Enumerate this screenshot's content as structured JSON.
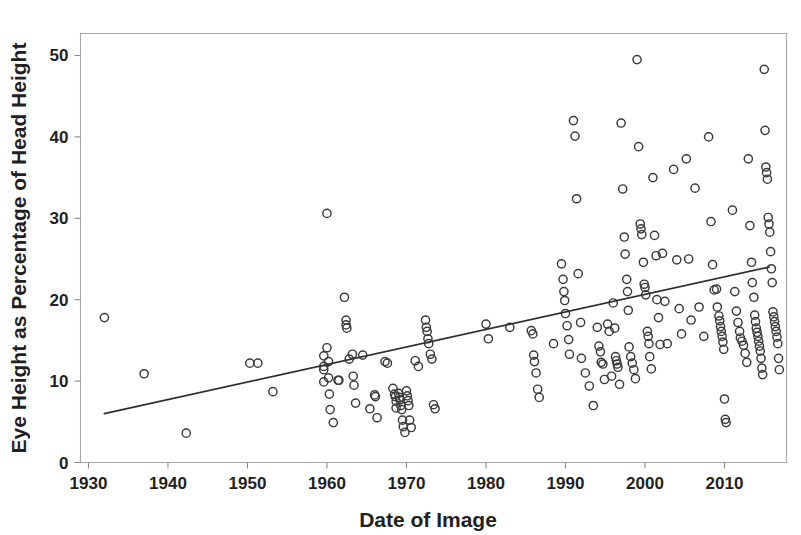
{
  "chart_data": {
    "type": "scatter",
    "title": "",
    "subtitle": "",
    "xlabel": "Date of Image",
    "ylabel": "Eye Height as Percentage of Head Height",
    "xlim": [
      1929.0,
      2017.8
    ],
    "ylim": [
      0,
      52.7
    ],
    "xticks": [
      1930,
      1940,
      1950,
      1960,
      1970,
      1980,
      1990,
      2000,
      2010
    ],
    "yticks": [
      0,
      10,
      20,
      30,
      40,
      50
    ],
    "xtick_labels": [
      "1930",
      "1940",
      "1950",
      "1960",
      "1970",
      "1980",
      "1990",
      "2000",
      "2010"
    ],
    "ytick_labels": [
      "0",
      "10",
      "20",
      "30",
      "40",
      "50"
    ],
    "grid": false,
    "legend": null,
    "legend_position": "none",
    "marker_style": "open-circle",
    "marker_color": "#3a3a3a",
    "frame_color": "#a8a8a8",
    "text_color": "#231f20",
    "background_color": "#ffffff",
    "annotations": [],
    "series": [
      {
        "name": "Eye height vs date",
        "marker": "open-circle",
        "points": [
          [
            1932.0,
            17.8
          ],
          [
            1937.0,
            10.9
          ],
          [
            1942.3,
            3.6
          ],
          [
            1950.3,
            12.2
          ],
          [
            1951.3,
            12.2
          ],
          [
            1953.2,
            8.7
          ],
          [
            1959.6,
            13.1
          ],
          [
            1959.6,
            11.8
          ],
          [
            1959.6,
            11.4
          ],
          [
            1959.6,
            9.9
          ],
          [
            1960.0,
            30.6
          ],
          [
            1960.0,
            14.1
          ],
          [
            1960.2,
            12.4
          ],
          [
            1960.2,
            10.4
          ],
          [
            1960.3,
            8.4
          ],
          [
            1960.4,
            6.5
          ],
          [
            1960.8,
            4.9
          ],
          [
            1961.4,
            10.1
          ],
          [
            1961.5,
            10.1
          ],
          [
            1962.2,
            20.3
          ],
          [
            1962.4,
            17.5
          ],
          [
            1962.4,
            16.9
          ],
          [
            1962.5,
            16.5
          ],
          [
            1962.8,
            12.7
          ],
          [
            1963.2,
            13.3
          ],
          [
            1963.3,
            10.6
          ],
          [
            1963.4,
            9.5
          ],
          [
            1963.6,
            7.3
          ],
          [
            1964.5,
            13.2
          ],
          [
            1965.4,
            6.6
          ],
          [
            1966.0,
            8.3
          ],
          [
            1966.1,
            8.1
          ],
          [
            1966.3,
            5.5
          ],
          [
            1967.3,
            12.4
          ],
          [
            1967.6,
            12.2
          ],
          [
            1968.3,
            9.1
          ],
          [
            1968.5,
            8.4
          ],
          [
            1968.6,
            8.1
          ],
          [
            1968.7,
            7.5
          ],
          [
            1968.7,
            6.7
          ],
          [
            1969.0,
            8.5
          ],
          [
            1969.1,
            8.0
          ],
          [
            1969.2,
            7.7
          ],
          [
            1969.3,
            7.0
          ],
          [
            1969.4,
            6.5
          ],
          [
            1969.5,
            5.2
          ],
          [
            1969.6,
            4.4
          ],
          [
            1969.8,
            3.7
          ],
          [
            1970.0,
            8.8
          ],
          [
            1970.1,
            8.2
          ],
          [
            1970.2,
            7.6
          ],
          [
            1970.3,
            7.0
          ],
          [
            1970.4,
            5.2
          ],
          [
            1970.6,
            4.3
          ],
          [
            1971.1,
            12.5
          ],
          [
            1971.5,
            11.8
          ],
          [
            1972.4,
            17.5
          ],
          [
            1972.5,
            16.6
          ],
          [
            1972.6,
            16.1
          ],
          [
            1972.7,
            15.2
          ],
          [
            1972.8,
            14.6
          ],
          [
            1973.0,
            13.3
          ],
          [
            1973.2,
            12.7
          ],
          [
            1973.4,
            7.1
          ],
          [
            1973.6,
            6.6
          ],
          [
            1980.0,
            17.0
          ],
          [
            1980.3,
            15.2
          ],
          [
            1983.0,
            16.6
          ],
          [
            1985.7,
            16.2
          ],
          [
            1985.9,
            15.8
          ],
          [
            1986.0,
            13.2
          ],
          [
            1986.1,
            12.4
          ],
          [
            1986.3,
            11.0
          ],
          [
            1986.5,
            9.0
          ],
          [
            1986.7,
            8.0
          ],
          [
            1988.5,
            14.6
          ],
          [
            1989.5,
            24.4
          ],
          [
            1989.7,
            22.5
          ],
          [
            1989.8,
            21.0
          ],
          [
            1989.9,
            19.9
          ],
          [
            1990.0,
            18.3
          ],
          [
            1990.2,
            16.8
          ],
          [
            1990.4,
            15.1
          ],
          [
            1990.5,
            13.3
          ],
          [
            1991.0,
            42.0
          ],
          [
            1991.2,
            40.1
          ],
          [
            1991.4,
            32.4
          ],
          [
            1991.6,
            23.2
          ],
          [
            1991.9,
            17.2
          ],
          [
            1992.0,
            12.8
          ],
          [
            1992.5,
            11.0
          ],
          [
            1993.0,
            9.4
          ],
          [
            1993.5,
            7.0
          ],
          [
            1994.0,
            16.6
          ],
          [
            1994.2,
            14.3
          ],
          [
            1994.4,
            13.6
          ],
          [
            1994.5,
            12.3
          ],
          [
            1994.7,
            12.1
          ],
          [
            1994.9,
            10.2
          ],
          [
            1995.3,
            17.0
          ],
          [
            1995.5,
            16.1
          ],
          [
            1995.8,
            10.6
          ],
          [
            1996.0,
            19.6
          ],
          [
            1996.2,
            16.5
          ],
          [
            1996.3,
            13.0
          ],
          [
            1996.4,
            12.5
          ],
          [
            1996.5,
            12.1
          ],
          [
            1996.6,
            11.7
          ],
          [
            1996.8,
            9.6
          ],
          [
            1997.0,
            41.7
          ],
          [
            1997.2,
            33.6
          ],
          [
            1997.4,
            27.7
          ],
          [
            1997.5,
            25.6
          ],
          [
            1997.7,
            22.5
          ],
          [
            1997.8,
            21.0
          ],
          [
            1997.9,
            18.7
          ],
          [
            1998.0,
            14.2
          ],
          [
            1998.2,
            13.0
          ],
          [
            1998.4,
            12.2
          ],
          [
            1998.6,
            11.4
          ],
          [
            1998.8,
            10.3
          ],
          [
            1999.0,
            49.5
          ],
          [
            1999.2,
            38.8
          ],
          [
            1999.4,
            29.3
          ],
          [
            1999.5,
            28.7
          ],
          [
            1999.6,
            28.0
          ],
          [
            1999.8,
            24.6
          ],
          [
            1999.9,
            21.9
          ],
          [
            2000.0,
            21.5
          ],
          [
            2000.1,
            20.6
          ],
          [
            2000.3,
            16.1
          ],
          [
            2000.4,
            15.5
          ],
          [
            2000.5,
            14.6
          ],
          [
            2000.6,
            13.0
          ],
          [
            2000.8,
            11.5
          ],
          [
            2001.0,
            35.0
          ],
          [
            2001.2,
            27.9
          ],
          [
            2001.4,
            25.4
          ],
          [
            2001.5,
            20.0
          ],
          [
            2001.7,
            17.8
          ],
          [
            2001.9,
            14.5
          ],
          [
            2002.2,
            25.7
          ],
          [
            2002.5,
            19.8
          ],
          [
            2002.8,
            14.6
          ],
          [
            2003.6,
            36.0
          ],
          [
            2004.0,
            24.9
          ],
          [
            2004.3,
            18.9
          ],
          [
            2004.6,
            15.8
          ],
          [
            2005.2,
            37.3
          ],
          [
            2005.5,
            25.0
          ],
          [
            2005.8,
            17.5
          ],
          [
            2006.3,
            33.7
          ],
          [
            2006.8,
            19.1
          ],
          [
            2007.4,
            15.5
          ],
          [
            2008.0,
            40.0
          ],
          [
            2008.3,
            29.6
          ],
          [
            2008.5,
            24.3
          ],
          [
            2008.7,
            21.2
          ],
          [
            2009.0,
            21.3
          ],
          [
            2009.1,
            19.1
          ],
          [
            2009.3,
            18.0
          ],
          [
            2009.4,
            17.4
          ],
          [
            2009.5,
            16.7
          ],
          [
            2009.6,
            16.1
          ],
          [
            2009.7,
            15.5
          ],
          [
            2009.8,
            14.8
          ],
          [
            2009.9,
            13.9
          ],
          [
            2010.0,
            7.8
          ],
          [
            2010.1,
            5.3
          ],
          [
            2010.2,
            4.9
          ],
          [
            2011.0,
            31.0
          ],
          [
            2011.3,
            21.0
          ],
          [
            2011.5,
            18.6
          ],
          [
            2011.7,
            17.2
          ],
          [
            2011.9,
            16.1
          ],
          [
            2012.0,
            15.3
          ],
          [
            2012.2,
            14.9
          ],
          [
            2012.4,
            14.4
          ],
          [
            2012.6,
            13.4
          ],
          [
            2012.8,
            12.3
          ],
          [
            2013.0,
            37.3
          ],
          [
            2013.2,
            29.1
          ],
          [
            2013.4,
            24.6
          ],
          [
            2013.5,
            22.1
          ],
          [
            2013.7,
            20.3
          ],
          [
            2013.8,
            18.1
          ],
          [
            2013.9,
            17.3
          ],
          [
            2014.0,
            16.5
          ],
          [
            2014.1,
            16.0
          ],
          [
            2014.2,
            15.5
          ],
          [
            2014.3,
            14.9
          ],
          [
            2014.4,
            14.3
          ],
          [
            2014.5,
            13.7
          ],
          [
            2014.6,
            12.8
          ],
          [
            2014.7,
            11.6
          ],
          [
            2014.8,
            10.8
          ],
          [
            2015.0,
            48.3
          ],
          [
            2015.1,
            40.8
          ],
          [
            2015.2,
            36.3
          ],
          [
            2015.3,
            35.6
          ],
          [
            2015.4,
            34.8
          ],
          [
            2015.5,
            30.1
          ],
          [
            2015.6,
            29.3
          ],
          [
            2015.7,
            28.3
          ],
          [
            2015.8,
            25.9
          ],
          [
            2015.9,
            23.8
          ],
          [
            2016.0,
            22.1
          ],
          [
            2016.1,
            18.5
          ],
          [
            2016.2,
            17.9
          ],
          [
            2016.3,
            17.3
          ],
          [
            2016.4,
            16.7
          ],
          [
            2016.5,
            16.1
          ],
          [
            2016.6,
            15.4
          ],
          [
            2016.7,
            14.6
          ],
          [
            2016.8,
            12.8
          ],
          [
            2016.9,
            11.4
          ]
        ]
      }
    ],
    "trendline": {
      "name": "linear fit",
      "x": [
        1932.0,
        2015.6
      ],
      "y": [
        6.0,
        24.0
      ],
      "color": "#2f2f2f"
    }
  }
}
